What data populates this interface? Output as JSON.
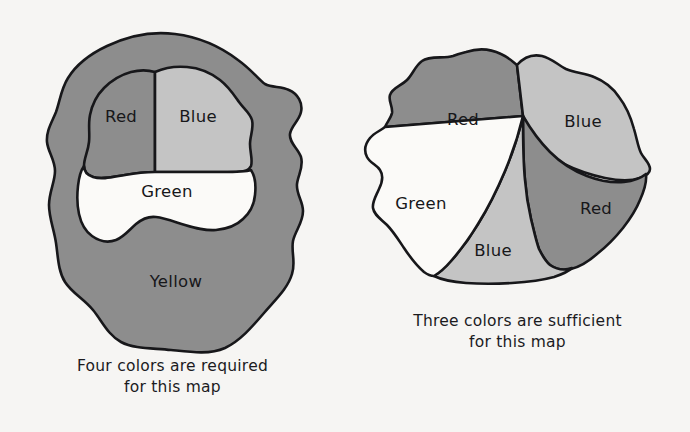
{
  "page": {
    "background_color": "#f6f5f3",
    "ink_color": "#17171a",
    "width": 690,
    "height": 432
  },
  "palette": {
    "shade_dark_gray": "#8d8d8d",
    "shade_light_gray": "#c4c4c4",
    "shade_white": "#fbfaf8",
    "outline": "#17171a"
  },
  "figures": [
    {
      "id": "four-color-map",
      "caption": {
        "line1": "Four colors are required",
        "line2": "for this map"
      },
      "region_count": 4,
      "colors_used": [
        "Red",
        "Blue",
        "Green",
        "Yellow"
      ],
      "regions": [
        {
          "label": "Red",
          "fill_name": "shade_dark_gray",
          "fill": "#8d8d8d",
          "label_x": 121,
          "label_y": 117
        },
        {
          "label": "Blue",
          "fill_name": "shade_light_gray",
          "fill": "#c4c4c4",
          "label_x": 198,
          "label_y": 117
        },
        {
          "label": "Green",
          "fill_name": "shade_white",
          "fill": "#fbfaf8",
          "label_x": 167,
          "label_y": 192
        },
        {
          "label": "Yellow",
          "fill_name": "shade_dark_gray",
          "fill": "#8d8d8d",
          "label_x": 176,
          "label_y": 282
        }
      ]
    },
    {
      "id": "three-color-map",
      "caption": {
        "line1": "Three colors are sufficient",
        "line2": "for this map"
      },
      "region_count": 5,
      "colors_used": [
        "Red",
        "Blue",
        "Green"
      ],
      "regions": [
        {
          "label": "Red",
          "fill_name": "shade_dark_gray",
          "fill": "#8d8d8d",
          "label_x": 118,
          "label_y": 120
        },
        {
          "label": "Blue",
          "fill_name": "shade_light_gray",
          "fill": "#c4c4c4",
          "label_x": 238,
          "label_y": 122
        },
        {
          "label": "Red",
          "fill_name": "shade_dark_gray",
          "fill": "#8d8d8d",
          "label_x": 251,
          "label_y": 209
        },
        {
          "label": "Blue",
          "fill_name": "shade_light_gray",
          "fill": "#c4c4c4",
          "label_x": 148,
          "label_y": 251
        },
        {
          "label": "Green",
          "fill_name": "shade_white",
          "fill": "#fbfaf8",
          "label_x": 76,
          "label_y": 204
        }
      ]
    }
  ]
}
